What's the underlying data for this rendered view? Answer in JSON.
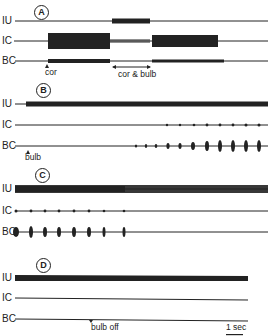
{
  "panels": [
    {
      "id": "A",
      "traces": [
        "IU",
        "IC",
        "BC"
      ],
      "annotations": [
        {
          "text": "cor"
        },
        {
          "text": "cor & bulb"
        }
      ]
    },
    {
      "id": "B",
      "traces": [
        "IU",
        "IC",
        "BC"
      ],
      "annotations": [
        {
          "text": "bulb"
        }
      ]
    },
    {
      "id": "C",
      "traces": [
        "IU",
        "IC",
        "BC"
      ],
      "annotations": []
    },
    {
      "id": "D",
      "traces": [
        "IU",
        "IC",
        "BC"
      ],
      "annotations": [
        {
          "text": "bulb off"
        }
      ]
    }
  ],
  "scale_bar": {
    "label": "1 sec"
  },
  "colors": {
    "ink": "#222222",
    "background": "#ffffff"
  }
}
